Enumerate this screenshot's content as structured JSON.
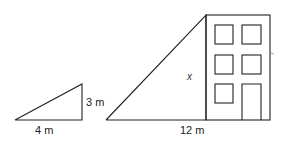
{
  "small_triangle": {
    "height_label": "3 m",
    "base_label": "4 m"
  },
  "large_triangle": {
    "height_label": "x",
    "base_label": "12 m"
  },
  "building": {
    "windows": 5,
    "door": 1
  }
}
